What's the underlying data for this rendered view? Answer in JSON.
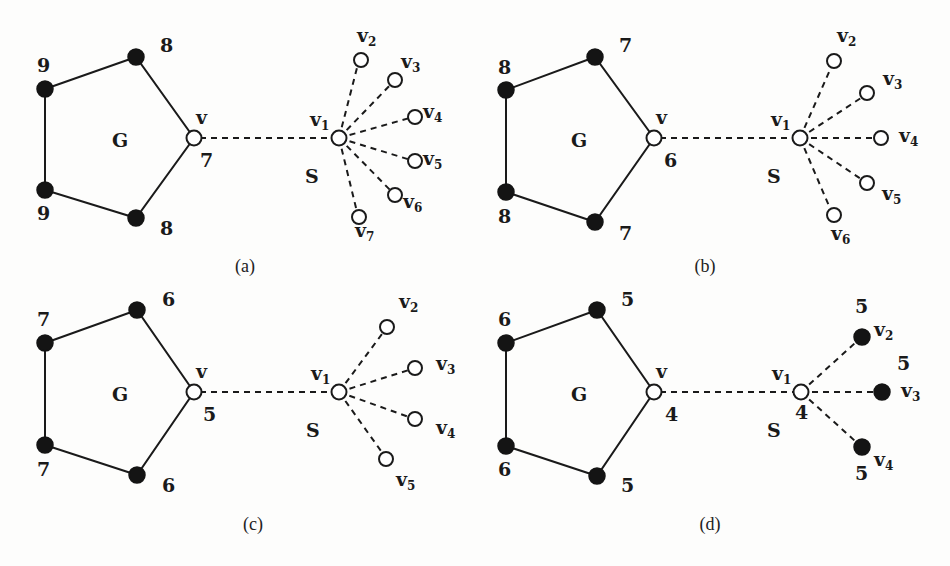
{
  "figure": {
    "panels": [
      {
        "id": "a",
        "caption": "(a)",
        "graph_label": "G",
        "star_label": "S",
        "v_label": "v",
        "v_value": "7",
        "v1_label": "v",
        "v1_sub": "1",
        "cycle_values": [
          "8",
          "9",
          "9",
          "8"
        ],
        "leaves": [
          {
            "label": "v",
            "sub": "2",
            "filled": false
          },
          {
            "label": "v",
            "sub": "3",
            "filled": false
          },
          {
            "label": "v",
            "sub": "4",
            "filled": false
          },
          {
            "label": "v",
            "sub": "5",
            "filled": false
          },
          {
            "label": "v",
            "sub": "6",
            "filled": false
          },
          {
            "label": "v",
            "sub": "7",
            "filled": false
          }
        ]
      },
      {
        "id": "b",
        "caption": "(b)",
        "graph_label": "G",
        "star_label": "S",
        "v_label": "v",
        "v_value": "6",
        "v1_label": "v",
        "v1_sub": "1",
        "cycle_values": [
          "7",
          "8",
          "8",
          "7"
        ],
        "leaves": [
          {
            "label": "v",
            "sub": "2",
            "filled": false
          },
          {
            "label": "v",
            "sub": "3",
            "filled": false
          },
          {
            "label": "v",
            "sub": "4",
            "filled": false
          },
          {
            "label": "v",
            "sub": "5",
            "filled": false
          },
          {
            "label": "v",
            "sub": "6",
            "filled": false
          }
        ]
      },
      {
        "id": "c",
        "caption": "(c)",
        "graph_label": "G",
        "star_label": "S",
        "v_label": "v",
        "v_value": "5",
        "v1_label": "v",
        "v1_sub": "1",
        "cycle_values": [
          "6",
          "7",
          "7",
          "6"
        ],
        "leaves": [
          {
            "label": "v",
            "sub": "2",
            "filled": false
          },
          {
            "label": "v",
            "sub": "3",
            "filled": false
          },
          {
            "label": "v",
            "sub": "4",
            "filled": false
          },
          {
            "label": "v",
            "sub": "5",
            "filled": false
          }
        ]
      },
      {
        "id": "d",
        "caption": "(d)",
        "graph_label": "G",
        "star_label": "S",
        "v_label": "v",
        "v_value": "4",
        "v1_label": "v",
        "v1_sub": "1",
        "v1_value": "4",
        "cycle_values": [
          "5",
          "6",
          "6",
          "5"
        ],
        "leaves": [
          {
            "label": "v",
            "sub": "2",
            "filled": true,
            "value": "5"
          },
          {
            "label": "v",
            "sub": "3",
            "filled": true,
            "value": "5"
          },
          {
            "label": "v",
            "sub": "4",
            "filled": true,
            "value": "5"
          }
        ]
      }
    ]
  }
}
